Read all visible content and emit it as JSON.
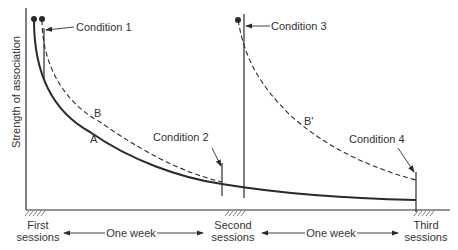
{
  "diagram": {
    "y_axis_label": "Strength of association",
    "x_axis": {
      "sessions": [
        {
          "label_line1": "First",
          "label_line2": "sessions"
        },
        {
          "label_line1": "Second",
          "label_line2": "sessions"
        },
        {
          "label_line1": "Third",
          "label_line2": "sessions"
        }
      ],
      "intervals": [
        {
          "label": "One week"
        },
        {
          "label": "One week"
        }
      ]
    },
    "curves": [
      {
        "label": "A",
        "style": "solid"
      },
      {
        "label": "B",
        "style": "dashed"
      },
      {
        "label": "B'",
        "style": "dashed"
      }
    ],
    "conditions": [
      {
        "label": "Condition 1"
      },
      {
        "label": "Condition 2"
      },
      {
        "label": "Condition 3"
      },
      {
        "label": "Condition 4"
      }
    ],
    "colors": {
      "ink": "#2a2a2a",
      "background": "#ffffff"
    }
  }
}
